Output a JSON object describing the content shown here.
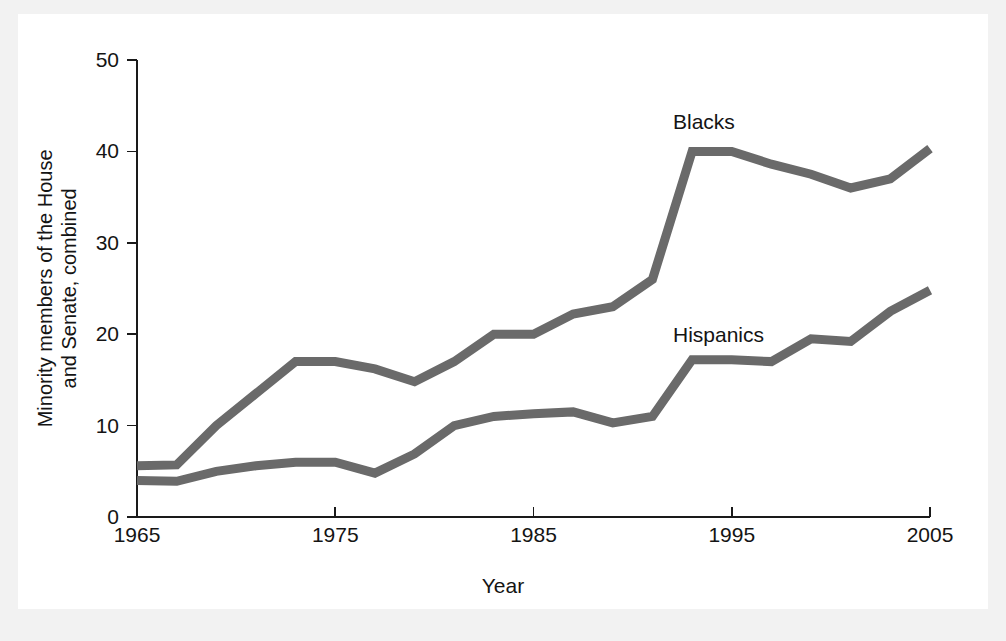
{
  "figure": {
    "background_color": "#ffffff",
    "page_color": "#f2f2f2",
    "line_color": "#6a6a6a",
    "text_color": "#141414"
  },
  "axes": {
    "x_title": "Year",
    "y_title_line1": "Minority members of the House",
    "y_title_line2": "and Senate, combined",
    "x_ticks": [
      "1965",
      "1975",
      "1985",
      "1995",
      "2005"
    ],
    "y_ticks": [
      "0",
      "10",
      "20",
      "30",
      "40",
      "50"
    ]
  },
  "labels": {
    "blacks": "Blacks",
    "hispanics": "Hispanics"
  },
  "chart_data": {
    "type": "line",
    "title": "",
    "xlabel": "Year",
    "ylabel": "Minority members of the House and Senate, combined",
    "xlim": [
      1965,
      2005
    ],
    "ylim": [
      0,
      50
    ],
    "xticks": [
      1965,
      1975,
      1985,
      1995,
      2005
    ],
    "yticks": [
      0,
      10,
      20,
      30,
      40,
      50
    ],
    "grid": false,
    "legend": "inline-labels",
    "x": [
      1965,
      1967,
      1969,
      1971,
      1973,
      1975,
      1977,
      1979,
      1981,
      1983,
      1985,
      1987,
      1989,
      1991,
      1993,
      1995,
      1997,
      1999,
      2001,
      2003,
      2005
    ],
    "series": [
      {
        "name": "Blacks",
        "color": "#6a6a6a",
        "values": [
          5.6,
          5.7,
          10.0,
          13.5,
          17.0,
          17.0,
          16.2,
          14.8,
          17.0,
          20.0,
          20.0,
          22.2,
          23.0,
          26.0,
          40.0,
          40.0,
          38.6,
          37.5,
          36.0,
          37.0,
          40.3
        ]
      },
      {
        "name": "Hispanics",
        "color": "#6a6a6a",
        "values": [
          4.0,
          3.9,
          5.0,
          5.6,
          6.0,
          6.0,
          4.8,
          6.9,
          10.0,
          11.0,
          11.3,
          11.5,
          10.3,
          11.0,
          17.2,
          17.2,
          17.0,
          19.5,
          19.2,
          22.5,
          24.8
        ]
      }
    ]
  }
}
